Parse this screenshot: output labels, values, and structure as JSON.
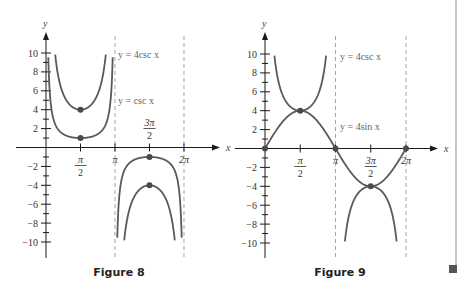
{
  "colors": {
    "axis": "#1a1a1a",
    "curve": "#5a5a5a",
    "point": "#4a4a4a",
    "asymptote": "#9a9a9a",
    "frame": "#8a8a8a",
    "end_mark": "#555555"
  },
  "chart_data": [
    {
      "type": "line",
      "title": "Figure 8",
      "xlabel": "x",
      "ylabel": "y",
      "xlim": [
        0,
        6.2832
      ],
      "ylim": [
        -10,
        10
      ],
      "grid": false,
      "x_ticks": [
        {
          "value": 1.5708,
          "num": "π",
          "den": "2",
          "position": "below"
        },
        {
          "value": 3.1416,
          "num": "π",
          "den": "",
          "position": "below"
        },
        {
          "value": 4.7124,
          "num": "3π",
          "den": "2",
          "position": "above"
        },
        {
          "value": 6.2832,
          "num": "2π",
          "den": "",
          "position": "below"
        }
      ],
      "y_ticks": [
        10,
        8,
        6,
        4,
        2,
        -2,
        -4,
        -6,
        -8,
        -10
      ],
      "asymptotes": [
        3.1416,
        6.2832
      ],
      "series": [
        {
          "name": "y = 4csc x",
          "fn": "4csc",
          "label": "y = 4csc x",
          "label_pos": [
            118,
            58
          ]
        },
        {
          "name": "y = csc x",
          "fn": "csc",
          "label": "y = csc x",
          "label_pos": [
            118,
            104
          ]
        }
      ],
      "points": [
        {
          "x": 1.5708,
          "y": 4
        },
        {
          "x": 1.5708,
          "y": 1
        },
        {
          "x": 4.7124,
          "y": -1
        },
        {
          "x": 4.7124,
          "y": -4
        }
      ],
      "caption": "Figure 8"
    },
    {
      "type": "line",
      "title": "Figure 9",
      "xlabel": "x",
      "ylabel": "y",
      "xlim": [
        0,
        6.2832
      ],
      "ylim": [
        -10,
        10
      ],
      "grid": false,
      "x_ticks": [
        {
          "value": 1.5708,
          "num": "π",
          "den": "2",
          "position": "below"
        },
        {
          "value": 3.1416,
          "num": "π",
          "den": "",
          "position": "below"
        },
        {
          "value": 4.7124,
          "num": "3π",
          "den": "2",
          "position": "below"
        },
        {
          "value": 6.2832,
          "num": "2π",
          "den": "",
          "position": "below"
        }
      ],
      "y_ticks": [
        10,
        8,
        6,
        4,
        2,
        -2,
        -4,
        -6,
        -8,
        -10
      ],
      "asymptotes": [
        3.1416,
        6.2832
      ],
      "series": [
        {
          "name": "y = 4csc x",
          "fn": "4csc",
          "label": "y = 4csc x",
          "label_pos": [
            340,
            60
          ]
        },
        {
          "name": "y = 4sin x",
          "fn": "4sin",
          "label": "y = 4sin x",
          "label_pos": [
            340,
            130
          ]
        }
      ],
      "points": [
        {
          "x": 0,
          "y": 0
        },
        {
          "x": 1.5708,
          "y": 4
        },
        {
          "x": 3.1416,
          "y": 0
        },
        {
          "x": 4.7124,
          "y": -4
        },
        {
          "x": 6.2832,
          "y": 0
        }
      ],
      "caption": "Figure 9"
    }
  ],
  "layout": [
    {
      "origin_x": 46,
      "origin_y": 147.5,
      "x_scale": 21.96,
      "y_scale": 9.45,
      "axis_x_end": 220,
      "axis_y_top": 32,
      "axis_y_bottom": 258,
      "asym_top": 36,
      "asym_bottom": 258,
      "caption_x": 119,
      "caption_y": 276
    },
    {
      "origin_x": 265,
      "origin_y": 148.5,
      "x_scale": 22.44,
      "y_scale": 9.45,
      "axis_x_end": 438,
      "axis_y_top": 32,
      "axis_y_bottom": 258,
      "asym_top": 36,
      "asym_bottom": 258,
      "caption_x": 340,
      "caption_y": 276
    }
  ]
}
